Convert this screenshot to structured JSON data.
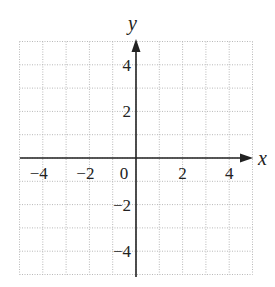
{
  "chart_data": {
    "type": "scatter",
    "title": "",
    "xlabel": "x",
    "ylabel": "y",
    "xlim": [
      -5,
      5
    ],
    "ylim": [
      -5,
      5
    ],
    "grid": true,
    "grid_style": "dotted",
    "grid_step": 1,
    "x_ticks": [
      {
        "value": -4,
        "label": "−4"
      },
      {
        "value": -2,
        "label": "−2"
      },
      {
        "value": 0,
        "label": "0"
      },
      {
        "value": 2,
        "label": "2"
      },
      {
        "value": 4,
        "label": "4"
      }
    ],
    "y_ticks": [
      {
        "value": 4,
        "label": "4"
      },
      {
        "value": 2,
        "label": "2"
      },
      {
        "value": -2,
        "label": "−2"
      },
      {
        "value": -4,
        "label": "−4"
      }
    ],
    "series": [],
    "colors": {
      "axis": "#222222",
      "grid": "#b8b8b8"
    }
  }
}
